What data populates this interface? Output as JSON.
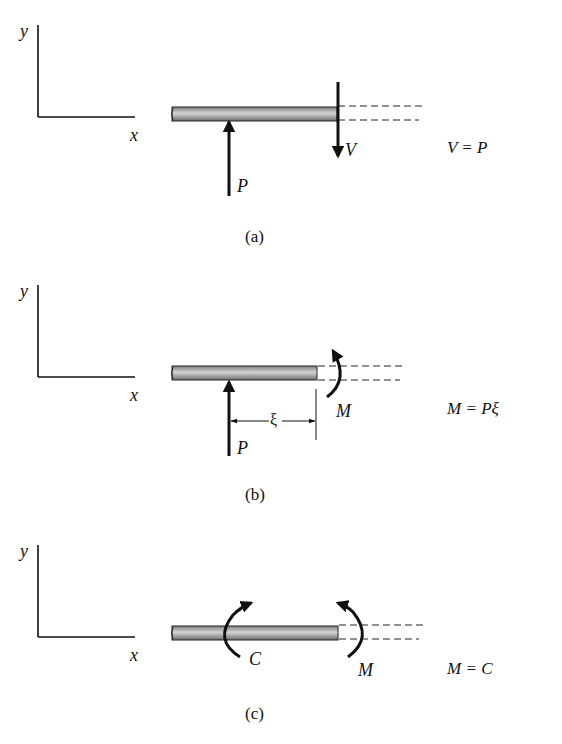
{
  "panels": [
    {
      "id": "a",
      "caption": "(a)",
      "axis": {
        "y_label": "y",
        "x_label": "x"
      },
      "forces": {
        "applied": "P",
        "internal": "V"
      },
      "equation": "V = P"
    },
    {
      "id": "b",
      "caption": "(b)",
      "axis": {
        "y_label": "y",
        "x_label": "x"
      },
      "forces": {
        "applied": "P",
        "internal": "M"
      },
      "dimension": "ξ",
      "equation": "M = Pξ"
    },
    {
      "id": "c",
      "caption": "(c)",
      "axis": {
        "y_label": "y",
        "x_label": "x"
      },
      "forces": {
        "applied": "C",
        "internal": "M"
      },
      "equation": "M = C"
    }
  ],
  "colors": {
    "ink": "#111111",
    "beam_fill": "#9a9a9a",
    "beam_highlight": "#cfcfcf",
    "background": "#ffffff"
  }
}
